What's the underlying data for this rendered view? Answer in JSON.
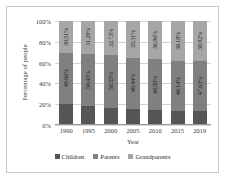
{
  "chart_data": {
    "type": "bar",
    "stacked": true,
    "stack_mode": "percent",
    "title": "",
    "xlabel": "Year",
    "ylabel": "Percentage of people",
    "categories": [
      "1990",
      "1995",
      "2000",
      "2005",
      "2010",
      "2015",
      "2019"
    ],
    "ylim": [
      0,
      100
    ],
    "ytick_labels": [
      "0%",
      "20%",
      "40%",
      "60%",
      "80%",
      "100%"
    ],
    "ytick_values": [
      0,
      20,
      40,
      60,
      80,
      100
    ],
    "grid": true,
    "legend_position": "bottom",
    "series": [
      {
        "name": "Children",
        "color": "#555555",
        "values": [
          20.43,
          18.26,
          16.72,
          15.25,
          14.54,
          13.68,
          13.45
        ],
        "labels": [
          "20.43%",
          "18.26%",
          "16.72%",
          "15.25%",
          "14.54%",
          "13.68%",
          "13.45%"
        ]
      },
      {
        "name": "Parents",
        "color": "#808080",
        "values": [
          49.06,
          50.45,
          50.55,
          49.44,
          48.5,
          48.14,
          47.63
        ],
        "labels": [
          "49.06%",
          "50.45%",
          "50.55%",
          "49.44%",
          "48.50%",
          "48.14%",
          "47.63%"
        ]
      },
      {
        "name": "Grandparents",
        "color": "#a6a6a6",
        "values": [
          30.51,
          31.29,
          32.73,
          35.31,
          36.96,
          38.18,
          38.92
        ],
        "labels": [
          "30.51%",
          "31.29%",
          "32.73%",
          "35.31%",
          "36.96%",
          "38.18%",
          "38.92%"
        ]
      }
    ]
  },
  "axes": {
    "y_title": "Percentage of people",
    "x_title": "Year",
    "y_ticks": [
      "100%",
      "80%",
      "60%",
      "40%",
      "20%",
      "0%"
    ],
    "x_ticks": [
      "1990",
      "1995",
      "2000",
      "2005",
      "2010",
      "2015",
      "2019"
    ]
  },
  "legend": {
    "items": [
      {
        "label": "Children",
        "color": "#555555"
      },
      {
        "label": "Parents",
        "color": "#808080"
      },
      {
        "label": "Grandparents",
        "color": "#a6a6a6"
      }
    ]
  }
}
